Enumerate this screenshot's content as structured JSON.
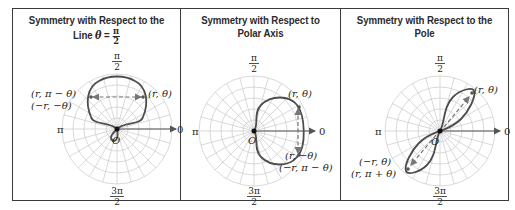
{
  "figure": {
    "type": "polar-symmetry-table",
    "colors": {
      "border": "#3a3a3a",
      "grid": "#c9c9c9",
      "curve": "#4d4d4d",
      "axis": "#555555",
      "text": "#231f20"
    },
    "panels": [
      {
        "id": "line-theta-pi-over-2",
        "title_line1": "Symmetry with Respect to the",
        "title_line2_prefix": "Line ",
        "title_line2_var": "θ",
        "title_line2_eq": " = ",
        "title_frac_num": "π",
        "title_frac_den": "2",
        "axis_labels": {
          "top_num": "π",
          "top_den": "2",
          "left": "π",
          "right": "0",
          "bottom_num": "3π",
          "bottom_den": "2"
        },
        "pole_label": "O",
        "point_labels": [
          "(r, π − θ)",
          "(−r, −θ)",
          "(r, θ)"
        ],
        "curve": "cardioid-up"
      },
      {
        "id": "polar-axis",
        "title_line1": "Symmetry with Respect to",
        "title_line2": "Polar Axis",
        "axis_labels": {
          "top_num": "π",
          "top_den": "2",
          "left": "π",
          "right": "0",
          "bottom_num": "3π",
          "bottom_den": "2"
        },
        "pole_label": "O",
        "point_labels": [
          "(r, θ)",
          "(r, −θ)",
          "(−r, π − θ)"
        ],
        "curve": "cardioid-right"
      },
      {
        "id": "pole",
        "title_line1": "Symmetry with Respect to the Pole",
        "axis_labels": {
          "top_num": "π",
          "top_den": "2",
          "left": "π",
          "right": "0",
          "bottom_num": "3π",
          "bottom_den": "2"
        },
        "pole_label": "O",
        "point_labels": [
          "(r, θ)",
          "(−r, θ)",
          "(r, π + θ)"
        ],
        "curve": "lemniscate-diagonal"
      }
    ]
  }
}
